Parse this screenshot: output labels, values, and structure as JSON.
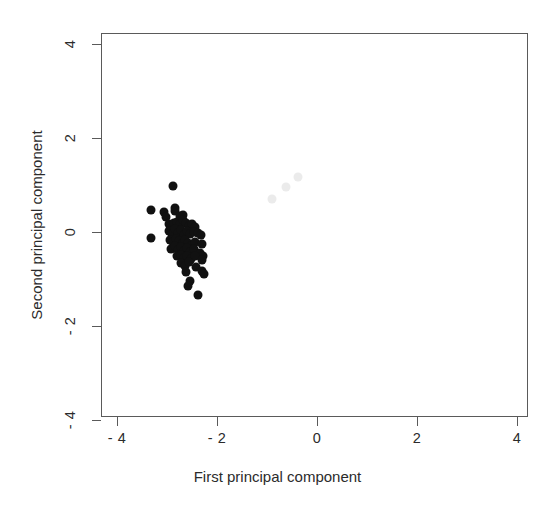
{
  "chart_data": {
    "type": "scatter",
    "title": "",
    "xlabel": "First principal component",
    "ylabel": "Second principal component",
    "xlim": [
      -4.32,
      4.22
    ],
    "ylim": [
      -4.3,
      4.46
    ],
    "xticks": [
      -4,
      -2,
      0,
      2,
      4
    ],
    "yticks": [
      -4,
      -2,
      0,
      2,
      4
    ],
    "xticklabels": [
      "- 4",
      "- 2",
      "0",
      "2",
      "4"
    ],
    "yticklabels": [
      "- 4",
      "- 2",
      "0",
      "2",
      "4"
    ],
    "grid": false,
    "legend": null,
    "marker": "filled-circle",
    "marker_size_px": 9,
    "series": [
      {
        "name": "dark-cluster",
        "color": "#111111",
        "points": [
          [
            -2.89,
            0.98
          ],
          [
            -3.33,
            0.46
          ],
          [
            -3.06,
            0.42
          ],
          [
            -3.02,
            0.31
          ],
          [
            -2.85,
            0.52
          ],
          [
            -2.84,
            0.44
          ],
          [
            -2.75,
            0.33
          ],
          [
            -2.69,
            0.36
          ],
          [
            -3.33,
            -0.12
          ],
          [
            -2.97,
            0.18
          ],
          [
            -2.92,
            0.12
          ],
          [
            -2.86,
            0.2
          ],
          [
            -2.8,
            0.22
          ],
          [
            -2.74,
            0.16
          ],
          [
            -2.68,
            0.25
          ],
          [
            -2.62,
            0.2
          ],
          [
            -2.56,
            0.13
          ],
          [
            -2.5,
            0.18
          ],
          [
            -2.44,
            0.11
          ],
          [
            -2.96,
            0.02
          ],
          [
            -2.9,
            -0.04
          ],
          [
            -2.84,
            0.06
          ],
          [
            -2.78,
            -0.02
          ],
          [
            -2.72,
            0.04
          ],
          [
            -2.66,
            -0.06
          ],
          [
            -2.6,
            0.02
          ],
          [
            -2.54,
            -0.04
          ],
          [
            -2.47,
            0.0
          ],
          [
            -2.38,
            -0.02
          ],
          [
            -2.32,
            -0.06
          ],
          [
            -2.95,
            -0.18
          ],
          [
            -2.88,
            -0.22
          ],
          [
            -2.82,
            -0.14
          ],
          [
            -2.76,
            -0.2
          ],
          [
            -2.7,
            -0.26
          ],
          [
            -2.64,
            -0.18
          ],
          [
            -2.58,
            -0.24
          ],
          [
            -2.52,
            -0.3
          ],
          [
            -2.45,
            -0.22
          ],
          [
            -2.3,
            -0.26
          ],
          [
            -2.92,
            -0.36
          ],
          [
            -2.85,
            -0.3
          ],
          [
            -2.79,
            -0.38
          ],
          [
            -2.72,
            -0.32
          ],
          [
            -2.66,
            -0.4
          ],
          [
            -2.6,
            -0.34
          ],
          [
            -2.54,
            -0.42
          ],
          [
            -2.47,
            -0.36
          ],
          [
            -2.34,
            -0.44
          ],
          [
            -2.28,
            -0.5
          ],
          [
            -2.8,
            -0.52
          ],
          [
            -2.73,
            -0.48
          ],
          [
            -2.67,
            -0.56
          ],
          [
            -2.6,
            -0.5
          ],
          [
            -2.52,
            -0.58
          ],
          [
            -2.45,
            -0.52
          ],
          [
            -2.3,
            -0.6
          ],
          [
            -2.72,
            -0.66
          ],
          [
            -2.64,
            -0.72
          ],
          [
            -2.56,
            -0.64
          ],
          [
            -2.42,
            -0.74
          ],
          [
            -2.62,
            -0.86
          ],
          [
            -2.3,
            -0.82
          ],
          [
            -2.26,
            -0.9
          ],
          [
            -2.55,
            -1.04
          ],
          [
            -2.58,
            -1.14
          ],
          [
            -2.38,
            -1.35
          ]
        ]
      },
      {
        "name": "light-cluster",
        "color": "#ebebeb",
        "points": [
          [
            -0.9,
            0.7
          ],
          [
            -0.62,
            0.96
          ],
          [
            -0.38,
            1.18
          ]
        ]
      }
    ]
  },
  "axis": {
    "xlabel": "First principal component",
    "ylabel": "Second principal component"
  }
}
